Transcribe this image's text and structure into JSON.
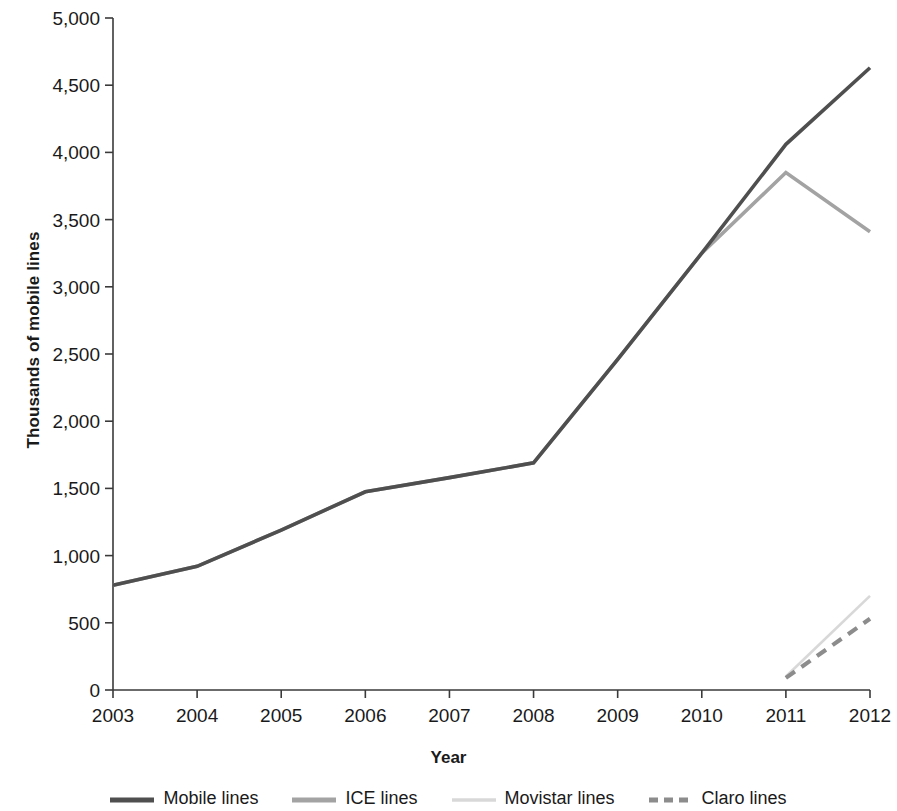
{
  "chart_data": {
    "type": "line",
    "title": "",
    "xlabel": "Year",
    "ylabel": "Thousands of mobile lines",
    "x": [
      2003,
      2004,
      2005,
      2006,
      2007,
      2008,
      2009,
      2010,
      2011,
      2012
    ],
    "xlim": [
      2003,
      2012
    ],
    "ylim": [
      0,
      5000
    ],
    "ytick_labels": [
      "5,000",
      "4,500",
      "4,000",
      "3,500",
      "3,000",
      "2,500",
      "2,000",
      "1,500",
      "1,000",
      "500",
      "0"
    ],
    "ytick_values": [
      5000,
      4500,
      4000,
      3500,
      3000,
      2500,
      2000,
      1500,
      1000,
      500,
      0
    ],
    "xtick_labels": [
      "2003",
      "2004",
      "2005",
      "2006",
      "2007",
      "2008",
      "2009",
      "2010",
      "2011",
      "2012"
    ],
    "grid": false,
    "legend_position": "bottom",
    "series": [
      {
        "name": "Mobile lines",
        "color": "#4f4f4f",
        "style": "solid",
        "width": 3.6,
        "x": [
          2003,
          2004,
          2005,
          2006,
          2007,
          2008,
          2009,
          2010,
          2011,
          2012
        ],
        "values": [
          780,
          920,
          1190,
          1475,
          1580,
          1690,
          2460,
          3250,
          4060,
          4630
        ]
      },
      {
        "name": "ICE lines",
        "color": "#a3a3a3",
        "style": "solid",
        "width": 3.6,
        "x": [
          2003,
          2004,
          2005,
          2006,
          2007,
          2008,
          2009,
          2010,
          2011,
          2012
        ],
        "values": [
          780,
          920,
          1190,
          1475,
          1580,
          1690,
          2460,
          3250,
          3850,
          3410
        ]
      },
      {
        "name": "Movistar lines",
        "color": "#d8d8d8",
        "style": "solid",
        "width": 2.6,
        "x": [
          2011,
          2012
        ],
        "values": [
          100,
          700
        ]
      },
      {
        "name": "Claro lines",
        "color": "#8c8c8c",
        "style": "dashed",
        "width": 4.2,
        "x": [
          2011,
          2012
        ],
        "values": [
          90,
          530
        ]
      }
    ]
  },
  "axis": {
    "y_title": "Thousands of mobile lines",
    "x_title": "Year"
  },
  "legend": {
    "items": [
      {
        "label": "Mobile lines"
      },
      {
        "label": "ICE lines"
      },
      {
        "label": "Movistar lines"
      },
      {
        "label": "Claro lines"
      }
    ]
  }
}
